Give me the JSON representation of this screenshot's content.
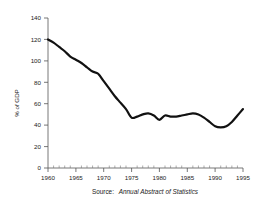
{
  "chart_data": {
    "type": "line",
    "title": "",
    "subtitle": "",
    "xlabel": "",
    "ylabel": "% of GDP",
    "source_prefix": "Source:",
    "source_title": "Annual Abstract of Statistics",
    "xlim": [
      1960,
      1995
    ],
    "ylim": [
      0,
      140
    ],
    "grid": false,
    "legend": "none",
    "x_ticks": [
      1960,
      1965,
      1970,
      1975,
      1980,
      1985,
      1990,
      1995
    ],
    "x_tick_labels": [
      "1960",
      "1965",
      "1970",
      "1975",
      "1980",
      "1985",
      "1990",
      "1995"
    ],
    "x_minor_tick_step": 1,
    "y_ticks": [
      0,
      20,
      40,
      60,
      80,
      100,
      120,
      140
    ],
    "y_tick_labels": [
      "0",
      "20",
      "40",
      "60",
      "80",
      "100",
      "120",
      "140"
    ],
    "series": [
      {
        "name": "Public sector debt",
        "color": "#111111",
        "x": [
          1960,
          1961,
          1962,
          1963,
          1964,
          1965,
          1966,
          1967,
          1968,
          1969,
          1970,
          1971,
          1972,
          1973,
          1974,
          1975,
          1976,
          1977,
          1978,
          1979,
          1980,
          1981,
          1982,
          1983,
          1984,
          1985,
          1986,
          1987,
          1988,
          1989,
          1990,
          1991,
          1992,
          1993,
          1994,
          1995
        ],
        "values": [
          120,
          117,
          113,
          109,
          104,
          101,
          98,
          94,
          90,
          88,
          81,
          74,
          67,
          61,
          55,
          47,
          48,
          50,
          51,
          49,
          45,
          49,
          48,
          48,
          49,
          50,
          51,
          50,
          47,
          43,
          39,
          38,
          39,
          43,
          49,
          55
        ]
      }
    ]
  }
}
